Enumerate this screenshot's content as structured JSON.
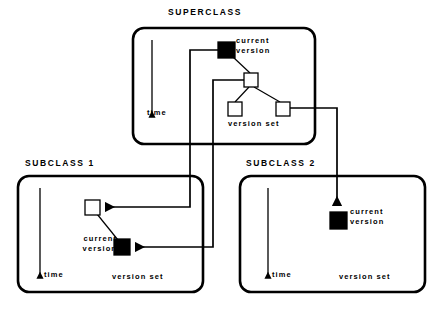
{
  "diagram": {
    "type": "object-version-hierarchy",
    "width": 442,
    "height": 309,
    "background_color": "#ffffff",
    "stroke_color": "#000000",
    "node_fill_current": "#000000",
    "node_fill_plain": "#ffffff"
  },
  "superclass": {
    "title": "SUPERCLASS",
    "time_label": "time",
    "version_set_label": "version set",
    "current_version_label_line1": "current",
    "current_version_label_line2": "version",
    "nodes": [
      {
        "id": "sc-root",
        "kind": "current-version",
        "fill": "#000000",
        "x": 218,
        "y": 42,
        "w": 17,
        "h": 16
      },
      {
        "id": "sc-mid",
        "kind": "version",
        "fill": "#ffffff",
        "x": 244,
        "y": 73,
        "w": 14,
        "h": 14
      },
      {
        "id": "sc-leaf-left",
        "kind": "version",
        "fill": "#ffffff",
        "x": 228,
        "y": 102,
        "w": 14,
        "h": 14
      },
      {
        "id": "sc-leaf-right",
        "kind": "version",
        "fill": "#ffffff",
        "x": 276,
        "y": 102,
        "w": 14,
        "h": 14
      }
    ]
  },
  "subclass_1": {
    "title": "SUBCLASS  1",
    "time_label": "time",
    "version_set_label": "version set",
    "current_version_label_line1": "current",
    "current_version_label_line2": "version",
    "nodes": [
      {
        "id": "s1-plain",
        "kind": "version",
        "fill": "#ffffff",
        "x": 85,
        "y": 200,
        "w": 15,
        "h": 15
      },
      {
        "id": "s1-current",
        "kind": "current-version",
        "fill": "#000000",
        "x": 114,
        "y": 239,
        "w": 16,
        "h": 16
      }
    ]
  },
  "subclass_2": {
    "title": "SUBCLASS  2",
    "time_label": "time",
    "version_set_label": "version set",
    "current_version_label_line1": "current",
    "current_version_label_line2": "version",
    "nodes": [
      {
        "id": "s2-current",
        "kind": "current-version",
        "fill": "#000000",
        "x": 330,
        "y": 212,
        "w": 17,
        "h": 17
      }
    ]
  },
  "connectors": [
    {
      "id": "sc-root-to-s1-plain",
      "from": "superclass.current-version",
      "to": "subclass_1.plain-version",
      "arrow": true
    },
    {
      "id": "sc-mid-to-s1-current",
      "from": "superclass.mid-version",
      "to": "subclass_1.current-version",
      "arrow": true
    },
    {
      "id": "sc-leafright-to-s2-current",
      "from": "superclass.leaf-right",
      "to": "subclass_2.current-version",
      "arrow": true
    }
  ]
}
